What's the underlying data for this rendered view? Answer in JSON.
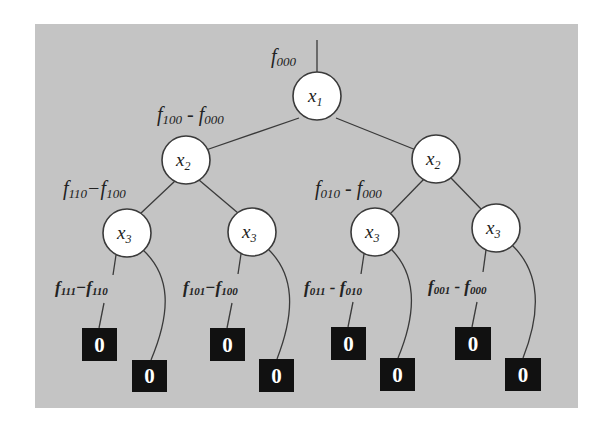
{
  "diagram": {
    "type": "binary-decision-tree",
    "colors": {
      "panel": "#c4c4c4",
      "node_fill": "#ffffff",
      "stroke": "#3a3a3a",
      "leaf_fill": "#111111",
      "leaf_text": "#ffffff"
    },
    "root_label": {
      "f": "f",
      "sub": "000"
    },
    "nodes": [
      {
        "id": "root",
        "var": "x",
        "sub": "1"
      },
      {
        "id": "l",
        "var": "x",
        "sub": "2"
      },
      {
        "id": "r",
        "var": "x",
        "sub": "2"
      },
      {
        "id": "ll",
        "var": "x",
        "sub": "3"
      },
      {
        "id": "lr",
        "var": "x",
        "sub": "3"
      },
      {
        "id": "rl",
        "var": "x",
        "sub": "3"
      },
      {
        "id": "rr",
        "var": "x",
        "sub": "3"
      }
    ],
    "edge_labels": [
      {
        "a": "f",
        "a_sub": "100",
        "op": " - ",
        "b": "f",
        "b_sub": "000"
      },
      {
        "a": "f",
        "a_sub": "110",
        "op": "−",
        "b": "f",
        "b_sub": "100"
      },
      {
        "a": "f",
        "a_sub": "010",
        "op": " - ",
        "b": "f",
        "b_sub": "000"
      },
      {
        "a": "f",
        "a_sub": "111",
        "op": "−",
        "b": "f",
        "b_sub": "110"
      },
      {
        "a": "f",
        "a_sub": "101",
        "op": "−",
        "b": "f",
        "b_sub": "100"
      },
      {
        "a": "f",
        "a_sub": "011",
        "op": " - ",
        "b": "f",
        "b_sub": "010"
      },
      {
        "a": "f",
        "a_sub": "001",
        "op": " - ",
        "b": "f",
        "b_sub": "000"
      }
    ],
    "leaves": [
      "0",
      "0",
      "0",
      "0",
      "0",
      "0",
      "0",
      "0"
    ]
  }
}
